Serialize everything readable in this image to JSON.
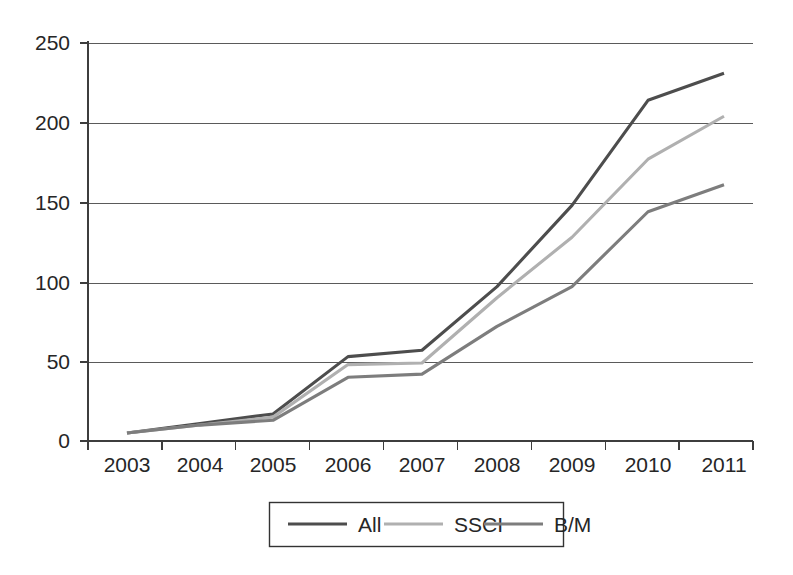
{
  "chart_data": {
    "type": "line",
    "title": "",
    "xlabel": "",
    "ylabel": "",
    "x": [
      "2003",
      "2004",
      "2005",
      "2006",
      "2007",
      "2008",
      "2009",
      "2010",
      "2011"
    ],
    "categories": [
      "2003",
      "2004",
      "2005",
      "2006",
      "2007",
      "2008",
      "2009",
      "2010",
      "2011"
    ],
    "series": [
      {
        "name": "All",
        "color": "#4d4d4d",
        "values": [
          5,
          11,
          17,
          53,
          57,
          97,
          148,
          214,
          231
        ]
      },
      {
        "name": "SSCI",
        "color": "#b0b0b0",
        "values": [
          5,
          10,
          15,
          48,
          49,
          90,
          128,
          177,
          204
        ]
      },
      {
        "name": "B/M",
        "color": "#7d7d7d",
        "values": [
          5,
          10,
          13,
          40,
          42,
          72,
          97,
          144,
          161
        ]
      }
    ],
    "ylim": [
      0,
      250
    ],
    "yticks": [
      0,
      50,
      100,
      150,
      200,
      250
    ],
    "ytick_labels": [
      "0",
      "50",
      "100",
      "150",
      "200",
      "250"
    ],
    "xtick_labels": [
      "2003",
      "2004",
      "2005",
      "2006",
      "2007",
      "2008",
      "2009",
      "2010",
      "2011"
    ],
    "grid": true,
    "grid_axis": "y",
    "legend_position": "bottom-center",
    "legend_entries": [
      "All",
      "SSCI",
      "B/M"
    ]
  },
  "axes": {
    "y": {
      "labels": [
        {
          "value": "250",
          "y": 43
        },
        {
          "value": "200",
          "y": 123
        },
        {
          "value": "150",
          "y": 203
        },
        {
          "value": "100",
          "y": 283
        },
        {
          "value": "50",
          "y": 362
        },
        {
          "value": "0",
          "y": 441
        }
      ]
    },
    "x": {
      "labels": [
        {
          "value": "2003",
          "x": 127
        },
        {
          "value": "2004",
          "x": 200
        },
        {
          "value": "2005",
          "x": 273
        },
        {
          "value": "2006",
          "x": 348
        },
        {
          "value": "2007",
          "x": 422
        },
        {
          "value": "2008",
          "x": 497
        },
        {
          "value": "2009",
          "x": 572
        },
        {
          "value": "2010",
          "x": 648
        },
        {
          "value": "2011",
          "x": 724
        }
      ]
    }
  },
  "legend": {
    "items": [
      {
        "label": "All",
        "color": "#4d4d4d"
      },
      {
        "label": "SSCI",
        "color": "#b0b0b0"
      },
      {
        "label": "B/M",
        "color": "#7d7d7d"
      }
    ]
  }
}
